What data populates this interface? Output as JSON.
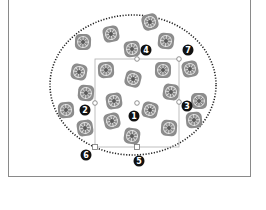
{
  "figure": {
    "colors": {
      "frame": "#8a8a8a",
      "bbox": "#b0b0b0",
      "ellipse": "#222222",
      "tile": "#8c8c8c",
      "callout_bg": "#111111",
      "callout_fg": "#ffffff"
    },
    "bounding_box": {
      "x": 95,
      "y": 59,
      "width": 84,
      "height": 88
    },
    "handles": [
      {
        "id": "top-mid",
        "x": 137,
        "y": 59,
        "shape": "circle"
      },
      {
        "id": "top-right",
        "x": 179,
        "y": 59,
        "shape": "circle"
      },
      {
        "id": "mid-left",
        "x": 95,
        "y": 103,
        "shape": "circle"
      },
      {
        "id": "mid-right",
        "x": 179,
        "y": 102,
        "shape": "circle"
      },
      {
        "id": "center",
        "x": 137,
        "y": 103,
        "shape": "circle"
      },
      {
        "id": "bottom-left",
        "x": 95,
        "y": 147,
        "shape": "square"
      },
      {
        "id": "bottom-mid",
        "x": 137,
        "y": 147,
        "shape": "square"
      }
    ],
    "callouts": [
      {
        "label": "1",
        "x": 134,
        "y": 116
      },
      {
        "label": "2",
        "x": 85,
        "y": 110
      },
      {
        "label": "3",
        "x": 187,
        "y": 106
      },
      {
        "label": "4",
        "x": 146,
        "y": 50
      },
      {
        "label": "5",
        "x": 139,
        "y": 161
      },
      {
        "label": "6",
        "x": 86,
        "y": 155
      },
      {
        "label": "7",
        "x": 188,
        "y": 50
      }
    ],
    "ellipse": {
      "cx": 133,
      "cy": 85,
      "rx": 83,
      "ry": 70
    },
    "tiles": [
      [
        150,
        22
      ],
      [
        83,
        42
      ],
      [
        111,
        34
      ],
      [
        166,
        41
      ],
      [
        132,
        49
      ],
      [
        79,
        72
      ],
      [
        106,
        70
      ],
      [
        133,
        79
      ],
      [
        163,
        70
      ],
      [
        190,
        69
      ],
      [
        86,
        93
      ],
      [
        114,
        101
      ],
      [
        171,
        92
      ],
      [
        66,
        110
      ],
      [
        150,
        110
      ],
      [
        199,
        101
      ],
      [
        112,
        121
      ],
      [
        169,
        128
      ],
      [
        85,
        128
      ],
      [
        132,
        136
      ],
      [
        194,
        120
      ]
    ]
  }
}
